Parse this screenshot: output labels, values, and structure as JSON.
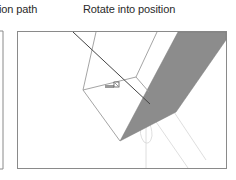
{
  "captions": {
    "left": "ion path",
    "right": "Rotate into position"
  },
  "colors": {
    "frame": "#8a8a8a",
    "face_fill": "#8c8c8c",
    "edge_dark": "#444444",
    "edge_light": "#9a9a9a",
    "guide": "#d8d8d8"
  },
  "panels": [
    {
      "name": "previous-panel-partial",
      "visible_portion": "right edge only"
    },
    {
      "name": "rotate-panel",
      "content": "3D box with shaded face being rotated, cursor at pivot"
    }
  ]
}
